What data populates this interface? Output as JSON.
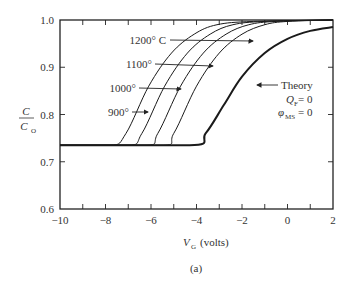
{
  "chart_data": {
    "type": "line",
    "title": "",
    "caption": "(a)",
    "xlabel": "V_G (volts)",
    "xlabel_main": "V",
    "xlabel_sub": "G",
    "xlabel_unit": "(volts)",
    "ylabel": "C / C_O",
    "ylabel_num": "C",
    "ylabel_den": "C",
    "ylabel_den_sub": "O",
    "xlim": [
      -10,
      2
    ],
    "ylim": [
      0.6,
      1.0
    ],
    "xticks": [
      "−10",
      "−8",
      "−6",
      "−4",
      "−2",
      "0",
      "2"
    ],
    "yticks": [
      "0.6",
      "0.7",
      "0.8",
      "0.9",
      "1.0"
    ],
    "grid": false,
    "series": [
      {
        "name": "1200° C",
        "label": "1200° C",
        "x": [
          -10,
          -5.6,
          -5.0,
          -4.0,
          -3.0,
          -2.0,
          -1.0,
          0.0,
          2.0
        ],
        "values": [
          0.735,
          0.735,
          0.76,
          0.86,
          0.93,
          0.97,
          0.99,
          0.997,
          1.0
        ]
      },
      {
        "name": "1100°",
        "label": "1100°",
        "x": [
          -10,
          -6.3,
          -5.7,
          -4.7,
          -3.7,
          -2.7,
          -1.7,
          -0.5,
          2.0
        ],
        "values": [
          0.735,
          0.735,
          0.76,
          0.86,
          0.93,
          0.97,
          0.99,
          0.997,
          1.0
        ]
      },
      {
        "name": "1000°",
        "label": "1000°",
        "x": [
          -10,
          -7.05,
          -6.4,
          -5.4,
          -4.4,
          -3.4,
          -2.4,
          -1.0,
          2.0
        ],
        "values": [
          0.735,
          0.735,
          0.76,
          0.86,
          0.93,
          0.97,
          0.99,
          0.997,
          1.0
        ]
      },
      {
        "name": "900°",
        "label": "900°",
        "x": [
          -10,
          -7.8,
          -7.1,
          -6.1,
          -5.1,
          -4.1,
          -3.1,
          -1.5,
          2.0
        ],
        "values": [
          0.735,
          0.735,
          0.76,
          0.86,
          0.93,
          0.97,
          0.99,
          0.997,
          1.0
        ]
      },
      {
        "name": "Theory",
        "label": "Theory",
        "x": [
          -10,
          -4.3,
          -3.6,
          -2.8,
          -2.0,
          -1.0,
          0.0,
          1.0,
          2.0
        ],
        "values": [
          0.735,
          0.735,
          0.76,
          0.82,
          0.88,
          0.93,
          0.96,
          0.977,
          0.985
        ]
      }
    ],
    "annotations": [
      {
        "text": "1200° C"
      },
      {
        "text": "1100°"
      },
      {
        "text": "1000°"
      },
      {
        "text": "900°"
      },
      {
        "text": "Theory"
      },
      {
        "text": "Q_F = 0",
        "main": "Q",
        "sub": "F",
        "rest": " = 0"
      },
      {
        "text": "φ_MS = 0",
        "main": "φ",
        "sub": "MS",
        "rest": " = 0"
      }
    ]
  }
}
